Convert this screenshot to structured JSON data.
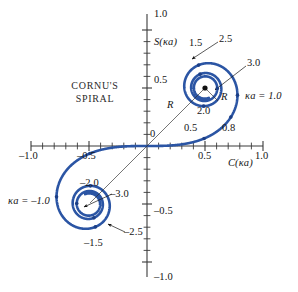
{
  "figure": {
    "title_line1": "CORNU'S",
    "title_line2": "SPIRAL",
    "axis_x_label": "C(κa)",
    "axis_y_label": "S(κa)",
    "origin_label": "0",
    "curve_color": "#2b55a4",
    "axis_color": "#3a3a3a",
    "text_color": "#141414"
  },
  "axes": {
    "x_ticks_labeled": [
      {
        "value": -1.0,
        "label": "–1.0"
      },
      {
        "value": -0.5,
        "label": "–0.5"
      },
      {
        "value": 0.5,
        "label": "0.5"
      },
      {
        "value": 1.0,
        "label": "1.0"
      }
    ],
    "y_ticks_labeled": [
      {
        "value": 1.0,
        "label": "1.0"
      },
      {
        "value": 0.5,
        "label": "0.5"
      },
      {
        "value": -0.5,
        "label": "–0.5"
      },
      {
        "value": -1.0,
        "label": "–1.0"
      }
    ],
    "xlim": [
      -1.1,
      1.1
    ],
    "ylim": [
      -1.1,
      1.1
    ],
    "tick_step": 0.1
  },
  "annotations": {
    "radius_upper": "R",
    "radius_inner_upper": "R",
    "kappa_upper": "κa = 1.0",
    "kappa_lower": "κa = –1.0",
    "marks_upper": [
      "0.5",
      "0.8",
      "1.5",
      "2.0",
      "2.5",
      "3.0"
    ],
    "marks_lower": [
      "–1.5",
      "–2.0",
      "–2.5",
      "–3.0"
    ]
  },
  "chart_data": {
    "type": "line",
    "title": "CORNU'S SPIRAL",
    "xlabel": "C(κa)",
    "ylabel": "S(κa)",
    "xlim": [
      -1.1,
      1.1
    ],
    "ylim": [
      -1.1,
      1.1
    ],
    "grid": false,
    "legend": "none",
    "parameter_name": "κa",
    "parameter_range": [
      -3.5,
      3.5
    ],
    "asymptote_points": [
      {
        "name": "upper eye",
        "x": 0.5,
        "y": 0.5
      },
      {
        "name": "lower eye",
        "x": -0.5,
        "y": -0.5
      }
    ],
    "marked_points": [
      {
        "param": 0.5,
        "x": 0.4923,
        "y": 0.0647,
        "label": "0.5"
      },
      {
        "param": 0.8,
        "x": 0.7648,
        "y": 0.2493,
        "label": "0.8"
      },
      {
        "param": 1.0,
        "x": 0.7799,
        "y": 0.4383,
        "label": "κa = 1.0"
      },
      {
        "param": 1.5,
        "x": 0.4453,
        "y": 0.6975,
        "label": "1.5"
      },
      {
        "param": 2.0,
        "x": 0.4883,
        "y": 0.3434,
        "label": "2.0"
      },
      {
        "param": 2.5,
        "x": 0.4574,
        "y": 0.6192,
        "label": "2.5"
      },
      {
        "param": 3.0,
        "x": 0.6057,
        "y": 0.4963,
        "label": "3.0"
      },
      {
        "param": -0.5,
        "x": -0.4923,
        "y": -0.0647,
        "label": ""
      },
      {
        "param": -1.0,
        "x": -0.7799,
        "y": -0.4383,
        "label": "κa = –1.0"
      },
      {
        "param": -1.5,
        "x": -0.4453,
        "y": -0.6975,
        "label": "–1.5"
      },
      {
        "param": -2.0,
        "x": -0.4883,
        "y": -0.3434,
        "label": "–2.0"
      },
      {
        "param": -2.5,
        "x": -0.4574,
        "y": -0.6192,
        "label": "–2.5"
      },
      {
        "param": -3.0,
        "x": -0.6057,
        "y": -0.4963,
        "label": "–3.0"
      }
    ],
    "series": [
      {
        "name": "Cornu spiral",
        "color": "#2b55a4",
        "x": [
          -0.5,
          -0.4,
          -0.3,
          -0.2,
          -0.1,
          0.0,
          0.1,
          0.2,
          0.3,
          0.4,
          0.5
        ],
        "values": [
          -0.5,
          -0.4,
          -0.3,
          -0.2,
          -0.1,
          0.0,
          0.1,
          0.2,
          0.3,
          0.4,
          0.5
        ]
      }
    ]
  }
}
